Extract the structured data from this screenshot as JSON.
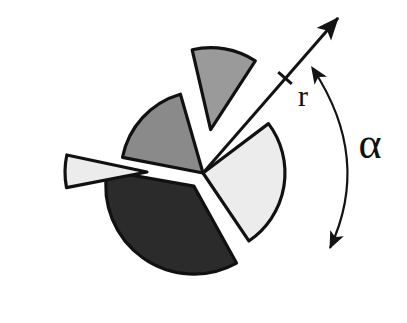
{
  "figure": {
    "background_color": "#ffffff",
    "width": 407,
    "height": 323,
    "center": {
      "x": 203,
      "y": 173
    },
    "base_radius": 82
  },
  "labels": {
    "radius_label": "r",
    "angle_label": "α"
  },
  "annotations": {
    "radius_arrow": {
      "name": "radius-arrow",
      "from": {
        "x": 203,
        "y": 173
      },
      "to": {
        "x": 338,
        "y": 18
      },
      "tick_at": {
        "x": 285,
        "y": 78
      },
      "label": "r",
      "label_position": {
        "x": 303,
        "y": 99
      },
      "color": "#131313",
      "double_headed": false
    },
    "angle_arc": {
      "name": "angle-arc",
      "start": {
        "x": 313,
        "y": 69
      },
      "end": {
        "x": 330,
        "y": 248
      },
      "bulge_x": 372,
      "label": "α",
      "label_position": {
        "x": 370,
        "y": 148
      },
      "color": "#131313",
      "double_headed": true
    }
  },
  "chart_data": {
    "type": "pie",
    "title": "",
    "xlabel": "",
    "ylabel": "",
    "legend_position": "none",
    "grid": false,
    "center": {
      "x": 203,
      "y": 173
    },
    "radius": 82,
    "total_degrees": 360,
    "slices": [
      {
        "name": "dark-sector",
        "label": "",
        "color": "#2b2b2b",
        "start_angle_deg": 61,
        "end_angle_deg": 190,
        "sweep_deg": 129,
        "value_fraction": 0.358,
        "exploded": true,
        "explode_offset_px": 16,
        "explode_direction_deg": 125,
        "radius": 88
      },
      {
        "name": "light-right-sector",
        "label": "",
        "color": "#ececec",
        "start_angle_deg": -37,
        "end_angle_deg": 56,
        "sweep_deg": 93,
        "value_fraction": 0.258,
        "exploded": false,
        "explode_offset_px": 0,
        "explode_direction_deg": 10,
        "radius": 82
      },
      {
        "name": "gray-bottom-left-sector",
        "label": "",
        "color": "#8a8a8a",
        "start_angle_deg": 191,
        "end_angle_deg": 254,
        "sweep_deg": 63,
        "value_fraction": 0.175,
        "exploded": false,
        "explode_offset_px": 0,
        "explode_direction_deg": 222,
        "radius": 82
      },
      {
        "name": "light-exploded-left-wedge",
        "label": "",
        "color": "#ececec",
        "start_angle_deg": 169,
        "end_angle_deg": 192,
        "sweep_deg": 23,
        "value_fraction": 0.064,
        "exploded": true,
        "explode_offset_px": 56,
        "explode_direction_deg": 181,
        "radius": 82
      },
      {
        "name": "gray-exploded-bottom-right-wedge",
        "label": "",
        "color": "#9a9a9a",
        "start_angle_deg": 257,
        "end_angle_deg": 303,
        "sweep_deg": 46,
        "value_fraction": 0.128,
        "exploded": true,
        "explode_offset_px": 44,
        "explode_direction_deg": 280,
        "radius": 82
      }
    ]
  }
}
